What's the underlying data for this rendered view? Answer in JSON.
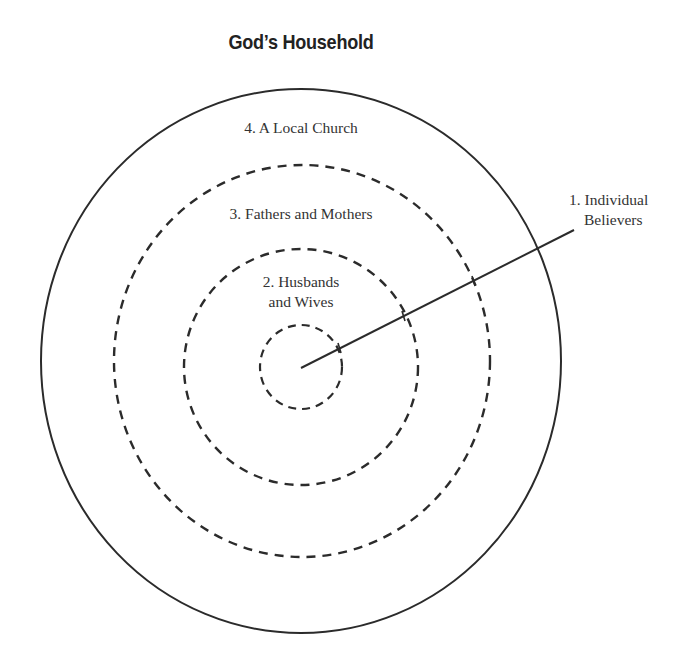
{
  "title": "God’s Household",
  "labels": {
    "ring4": "4. A Local Church",
    "ring3": "3. Fathers and Mothers",
    "ring2_line1": "2. Husbands",
    "ring2_line2": "and Wives",
    "ring1_line1": "1. Individual",
    "ring1_line2": "Believers"
  },
  "colors": {
    "stroke": "#2b2b2b",
    "text": "#333333",
    "background": "#ffffff"
  },
  "rings": [
    {
      "id": 1,
      "name": "Individual Believers",
      "style": "dashed"
    },
    {
      "id": 2,
      "name": "Husbands and Wives",
      "style": "dashed"
    },
    {
      "id": 3,
      "name": "Fathers and Mothers",
      "style": "dashed"
    },
    {
      "id": 4,
      "name": "A Local Church",
      "style": "solid"
    }
  ]
}
